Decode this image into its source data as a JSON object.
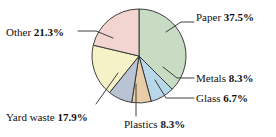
{
  "chart_data": {
    "type": "pie",
    "title": "",
    "subtitle": "",
    "xlabel": "",
    "ylabel": "",
    "legend_position": "none",
    "grid": false,
    "labels_outside_with_leader_lines": true,
    "categories": [
      "Paper",
      "Metals",
      "Glass",
      "Plastics",
      "Yard waste",
      "Other"
    ],
    "values": [
      37.5,
      8.3,
      6.7,
      8.3,
      17.9,
      21.3
    ],
    "units": "percent",
    "slices": [
      {
        "name": "Paper",
        "label_name": "Paper",
        "value": 37.5,
        "value_text": "37.5%",
        "color": "#c8dcc4",
        "start_angle_deg": 0,
        "end_angle_deg": 135,
        "label_side": "right"
      },
      {
        "name": "Metals",
        "label_name": "Metals",
        "value": 8.3,
        "value_text": "8.3%",
        "color": "#b8d8ea",
        "start_angle_deg": 135,
        "end_angle_deg": 164.88,
        "label_side": "right"
      },
      {
        "name": "Glass",
        "label_name": "Glass",
        "value": 6.7,
        "value_text": "6.7%",
        "color": "#e8cda8",
        "start_angle_deg": 164.88,
        "end_angle_deg": 189,
        "label_side": "right"
      },
      {
        "name": "Plastics",
        "label_name": "Plastics",
        "value": 8.3,
        "value_text": "8.3%",
        "color": "#b8c4d4",
        "start_angle_deg": 189,
        "end_angle_deg": 218.88,
        "label_side": "bottom"
      },
      {
        "name": "Yard waste",
        "label_name": "Yard waste",
        "value": 17.9,
        "value_text": "17.9%",
        "color": "#f5f2c8",
        "start_angle_deg": 218.88,
        "end_angle_deg": 283.32,
        "label_side": "left"
      },
      {
        "name": "Other",
        "label_name": "Other",
        "value": 21.3,
        "value_text": "21.3%",
        "color": "#f2d4d0",
        "start_angle_deg": 283.32,
        "end_angle_deg": 360,
        "label_side": "left"
      }
    ],
    "geometry": {
      "center_x": 139,
      "center_y": 56,
      "radius": 47
    }
  }
}
